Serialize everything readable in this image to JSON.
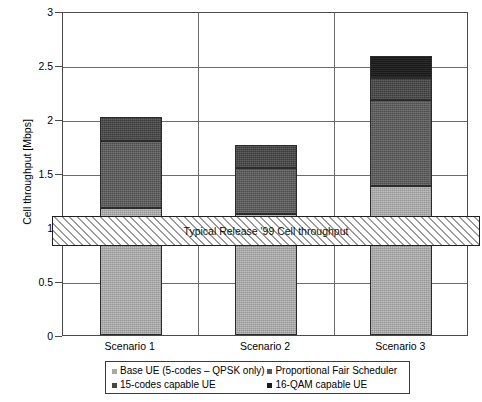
{
  "chart_data": {
    "type": "bar",
    "subtype": "stacked-column",
    "title": "",
    "xlabel": "",
    "ylabel": "Cell throughput [Mbps]",
    "ylim": [
      0,
      3
    ],
    "ytick_values": [
      0,
      0.5,
      1,
      1.5,
      2,
      2.5,
      3
    ],
    "ytick_labels": [
      "0",
      "0.5",
      "1",
      "1.5",
      "2",
      "2.5",
      "3"
    ],
    "grid": true,
    "legend_position": "bottom",
    "categories": [
      "Scenario 1",
      "Scenario 2",
      "Scenario 3"
    ],
    "series": [
      {
        "name": "Base UE (5-codes – QPSK only)",
        "color": "#a8a8a8",
        "values": [
          1.18,
          1.12,
          1.38
        ]
      },
      {
        "name": "Proportional Fair Scheduler",
        "color": "#595959",
        "values": [
          0.62,
          0.43,
          0.8
        ]
      },
      {
        "name": "15-codes capable UE",
        "color": "#464646",
        "values": [
          0.22,
          0.21,
          0.2
        ]
      },
      {
        "name": "16-QAM capable UE",
        "color": "#1b1b1b",
        "values": [
          0.0,
          0.0,
          0.2
        ]
      }
    ],
    "cumulative_totals": [
      2.02,
      1.76,
      2.58
    ],
    "annotations": [
      {
        "type": "hatched-band",
        "label": "Typical Release '99 Cell throughput",
        "y_from": 0.84,
        "y_to": 1.12
      }
    ]
  },
  "axes": {
    "y_title": "Cell throughput [Mbps]",
    "y_ticks": [
      "3",
      "2.5",
      "2",
      "1.5",
      "1",
      "0.5",
      "0"
    ],
    "x_ticks": [
      "Scenario 1",
      "Scenario 2",
      "Scenario 3"
    ]
  },
  "band": {
    "label": "Typical Release '99 Cell throughput"
  },
  "legend": {
    "items": [
      {
        "label": "Base UE (5-codes – QPSK only)",
        "color": "#a8a8a8"
      },
      {
        "label": "Proportional Fair Scheduler",
        "color": "#595959"
      },
      {
        "label": "15-codes capable UE",
        "color": "#464646"
      },
      {
        "label": "16-QAM capable UE",
        "color": "#1b1b1b"
      }
    ]
  }
}
